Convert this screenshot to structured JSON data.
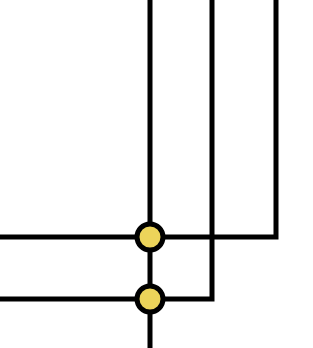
{
  "diagram": {
    "type": "wire-junction",
    "colors": {
      "wire": "#000000",
      "node_fill": "#ecd45a",
      "node_stroke": "#000000",
      "background": "#ffffff"
    },
    "wire_width": 5,
    "wires": [
      {
        "id": "v1",
        "points": [
          [
            150,
            0
          ],
          [
            150,
            348
          ]
        ]
      },
      {
        "id": "w2",
        "points": [
          [
            212,
            0
          ],
          [
            212,
            299
          ],
          [
            0,
            299
          ]
        ]
      },
      {
        "id": "w3",
        "points": [
          [
            276,
            0
          ],
          [
            276,
            237
          ],
          [
            0,
            237
          ]
        ]
      }
    ],
    "nodes": [
      {
        "id": "junction-top",
        "cx": 150,
        "cy": 237,
        "r": 13
      },
      {
        "id": "junction-bottom",
        "cx": 150,
        "cy": 299,
        "r": 13
      }
    ]
  }
}
